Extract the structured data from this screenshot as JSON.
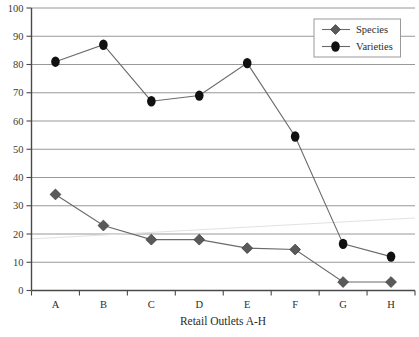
{
  "chart_data": {
    "type": "line",
    "title": "",
    "xlabel": "Retail Outlets A-H",
    "ylabel": "",
    "categories": [
      "A",
      "B",
      "C",
      "D",
      "E",
      "F",
      "G",
      "H"
    ],
    "series": [
      {
        "name": "Species",
        "marker": "diamond",
        "color": "#5a5a5a",
        "values": [
          34,
          23,
          18,
          18,
          15,
          14.5,
          3,
          3
        ]
      },
      {
        "name": "Varieties",
        "marker": "circle",
        "color": "#111111",
        "values": [
          81,
          87,
          67,
          69,
          80.5,
          54.5,
          16.5,
          12
        ]
      }
    ],
    "ylim": [
      0,
      100
    ],
    "ytick_values": [
      0,
      10,
      20,
      30,
      40,
      50,
      60,
      70,
      80,
      90,
      100
    ],
    "ytick_labels": [
      "0",
      "10",
      "20",
      "30",
      "40",
      "50",
      "60",
      "70",
      "80",
      "90",
      "100"
    ],
    "grid": true,
    "grid_axis": "y",
    "grid_color": "#8d8d8d",
    "legend_position": "top-right",
    "axis_color": "#4a4a4a",
    "background": "#ffffff"
  },
  "legend": {
    "entries": [
      {
        "label": "Species"
      },
      {
        "label": "Varieties"
      }
    ]
  },
  "axes": {
    "x_title": "Retail Outlets A-H"
  }
}
